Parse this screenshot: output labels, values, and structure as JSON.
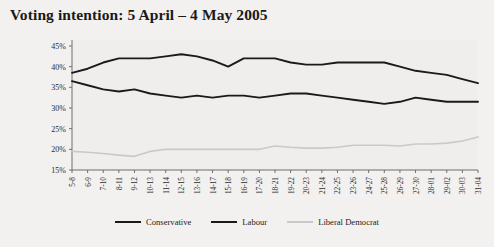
{
  "chart_data": {
    "type": "line",
    "title": "Voting intention: 5 April – 4 May 2005",
    "xlabel": "",
    "ylabel": "",
    "ylim": [
      15,
      45
    ],
    "ytick_step": 5,
    "grid": false,
    "legend_position": "bottom",
    "ytick_labels": [
      "15%",
      "20%",
      "25%",
      "30%",
      "35%",
      "40%",
      "45%"
    ],
    "categories": [
      "5-8",
      "6-9",
      "7-10",
      "8-11",
      "9-12",
      "10-13",
      "11-14",
      "12-15",
      "13-16",
      "14-17",
      "15-18",
      "16-19",
      "17-20",
      "18-21",
      "19-22",
      "20-23",
      "21-24",
      "22-25",
      "23-26",
      "24-27",
      "25-28",
      "26-29",
      "27-30",
      "28-01",
      "29-02",
      "30-03",
      "31-04"
    ],
    "series": [
      {
        "name": "Conservative",
        "color": "#1a1a1a",
        "values": [
          38.5,
          39.5,
          41.0,
          42.0,
          42.0,
          42.0,
          42.5,
          43.0,
          42.5,
          41.5,
          40.0,
          42.0,
          42.0,
          42.0,
          41.0,
          40.5,
          40.5,
          41.0,
          41.0,
          41.0,
          41.0,
          40.0,
          39.0,
          38.5,
          38.0,
          37.0,
          36.0
        ]
      },
      {
        "name": "Labour",
        "color": "#1a1a1a",
        "values": [
          36.5,
          35.5,
          34.5,
          34.0,
          34.5,
          33.5,
          33.0,
          32.5,
          33.0,
          32.5,
          33.0,
          33.0,
          32.5,
          33.0,
          33.5,
          33.5,
          33.0,
          32.5,
          32.0,
          31.5,
          31.0,
          31.5,
          32.5,
          32.0,
          31.5,
          31.5,
          31.5
        ]
      },
      {
        "name": "Liberal Democrat",
        "color": "#c9c9c9",
        "values": [
          19.5,
          19.3,
          19.0,
          18.6,
          18.3,
          19.5,
          20.0,
          20.0,
          20.0,
          20.0,
          20.0,
          20.0,
          20.0,
          20.8,
          20.5,
          20.3,
          20.3,
          20.5,
          21.0,
          21.0,
          21.0,
          20.8,
          21.3,
          21.3,
          21.5,
          22.0,
          23.0
        ]
      }
    ]
  }
}
